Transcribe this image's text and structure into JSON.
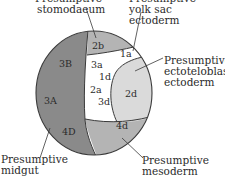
{
  "diagram": {
    "type": "cell-fate map",
    "colors": {
      "dark_region": "#8a8a8a",
      "mid_region": "#b4b4b4",
      "light_region": "#dadada",
      "white_region": "#ffffff",
      "outline": "#3a3a3a"
    },
    "cells": {
      "c2b": "2b",
      "c1a": "1a",
      "c3B": "3B",
      "c3a": "3a",
      "c1d": "1d",
      "c2a": "2a",
      "c3d": "3d",
      "c3A": "3A",
      "c2d": "2d",
      "c4d": "4d",
      "c4D": "4D"
    },
    "labels": {
      "stomodaeum": [
        "Presumptive",
        "stomodaeum"
      ],
      "yolk_sac": [
        "Presumptive",
        "yolk sac",
        "ectoderm"
      ],
      "ectoteloblast": [
        "Presumptive",
        "ectoteloblast",
        "ectoderm"
      ],
      "midgut": [
        "Presumptive",
        "midgut"
      ],
      "mesoderm": [
        "Presumptive",
        "mesoderm"
      ]
    }
  }
}
